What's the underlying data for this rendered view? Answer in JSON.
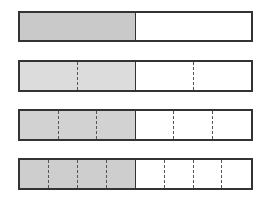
{
  "diagram": {
    "bars": [
      {
        "parts": 2,
        "shaded_parts": 1,
        "fraction": "1/2",
        "shade_color": "#c9c9c9",
        "top": 11,
        "height": 31
      },
      {
        "parts": 4,
        "shaded_parts": 2,
        "fraction": "2/4",
        "shade_color": "#dcdcdc",
        "top": 60,
        "height": 32
      },
      {
        "parts": 6,
        "shaded_parts": 3,
        "fraction": "3/6",
        "shade_color": "#d2d2d2",
        "top": 109,
        "height": 32
      },
      {
        "parts": 8,
        "shaded_parts": 4,
        "fraction": "4/8",
        "shade_color": "#cecece",
        "top": 158,
        "height": 32
      }
    ],
    "border_color": "#333333",
    "divider_style": "dashed"
  }
}
